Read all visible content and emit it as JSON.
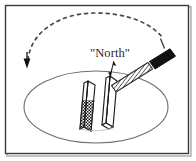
{
  "figure": {
    "background_color": "#ffffff",
    "width": 196,
    "height": 161,
    "labels": {
      "north": "\"North\""
    },
    "frame": {
      "name": "figure-border",
      "stroke_color": "#3a3a3a",
      "shadow_color": "#9a9a9a",
      "line_width": 1.4,
      "x": 5,
      "y": 5,
      "width": 184,
      "height": 149
    },
    "plane_ellipse": {
      "name": "horizontal-plane-ellipse",
      "stroke_color": "#6e6e6e",
      "line_width": 1.1,
      "cx": 96,
      "cy": 107,
      "rx": 72,
      "ry": 36
    },
    "dashed_arc": {
      "name": "rotation-dashed-arc",
      "stroke_color": "#4a4a4a",
      "line_width": 1.6,
      "dash_pattern": "3 4",
      "description": "dashed arc sweeping from upper right down to the left"
    },
    "arrowhead": {
      "name": "rotation-arrowhead",
      "fill_color": "#111111",
      "direction": "down",
      "x": 27,
      "y": 63
    },
    "needle_dark": {
      "name": "compass-needle-dark",
      "fill_color": "#1c1c1c",
      "stroke_color": "#1c1c1c",
      "pattern": "stipple",
      "description": "left compass needle, lower half dark hatched"
    },
    "needle_light": {
      "name": "compass-needle-light",
      "fill_color": "#ffffff",
      "stroke_color": "#1c1c1c",
      "description": "right compass needle, white outlined"
    },
    "pointer_arrow": {
      "name": "needle-pointer-arrow",
      "fill_color": "#111111",
      "description": "small black arrow above right needle"
    },
    "hatched_rod": {
      "name": "hatched-rod",
      "stroke_color": "#2a2a2a",
      "fill_color": "#ffffff",
      "pattern": "cross-hatch",
      "description": "diagonal striped rod running up to the right"
    },
    "bar_magnet": {
      "name": "bar-magnet",
      "fill_color": "#111111",
      "description": "solid black bar magnet at end of rod"
    },
    "tick_mark": {
      "name": "magnet-tick-mark",
      "stroke_color": "#3a3a3a",
      "description": "short line above the bar magnet"
    }
  }
}
